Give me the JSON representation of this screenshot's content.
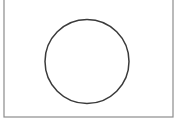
{
  "figure": {
    "background_color": "#ffffff",
    "canvas": {
      "width": 180,
      "height": 123
    },
    "shapes": [
      {
        "name": "rectangle-frame",
        "type": "rectangle",
        "x": 4,
        "y": -2,
        "width": 169,
        "height": 119,
        "fill": "none",
        "stroke_color": "#8c8c8c",
        "stroke_width": 1.2,
        "label": "Rectangle"
      },
      {
        "name": "circle-outline",
        "type": "circle",
        "cx": 87,
        "cy": 61.5,
        "r": 42,
        "fill": "none",
        "stroke_color": "#3a3a3a",
        "stroke_width": 1.5,
        "label": "Circle"
      }
    ]
  }
}
